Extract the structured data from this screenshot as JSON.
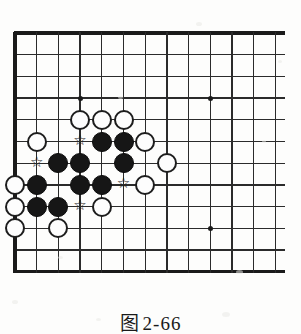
{
  "figure": {
    "caption_label": "图",
    "caption_number": "2-66",
    "caption_full": "图 2-66"
  },
  "board": {
    "type": "go-board-corner",
    "description": "Go board upper-left corner diagram",
    "visible_columns": 13,
    "visible_rows": 12,
    "grid_spacing_px": 21.7,
    "origin_x_px": 15,
    "origin_y_px": 33,
    "edges": [
      "left",
      "top",
      "bottom"
    ],
    "line_color": "#2b2b2b",
    "edge_color": "#1a1a1a",
    "background_color": "#fdfdfc",
    "hoshi_points": [
      {
        "col": 3,
        "row": 3
      },
      {
        "col": 9,
        "row": 3
      },
      {
        "col": 9,
        "row": 9
      }
    ],
    "stone_diameter_px": 20,
    "black_color": "#161616",
    "white_color": "#fdfdfd",
    "black_stones": [
      {
        "col": 4,
        "row": 5
      },
      {
        "col": 5,
        "row": 5
      },
      {
        "col": 2,
        "row": 6
      },
      {
        "col": 3,
        "row": 6
      },
      {
        "col": 5,
        "row": 6
      },
      {
        "col": 1,
        "row": 7
      },
      {
        "col": 3,
        "row": 7
      },
      {
        "col": 4,
        "row": 7
      },
      {
        "col": 1,
        "row": 8
      },
      {
        "col": 2,
        "row": 8
      }
    ],
    "white_stones": [
      {
        "col": 3,
        "row": 4
      },
      {
        "col": 4,
        "row": 4
      },
      {
        "col": 5,
        "row": 4
      },
      {
        "col": 1,
        "row": 5
      },
      {
        "col": 6,
        "row": 5
      },
      {
        "col": 7,
        "row": 6
      },
      {
        "col": 0,
        "row": 7
      },
      {
        "col": 6,
        "row": 7
      },
      {
        "col": 0,
        "row": 8
      },
      {
        "col": 4,
        "row": 8
      },
      {
        "col": 0,
        "row": 9
      },
      {
        "col": 2,
        "row": 9
      }
    ],
    "star_markers": [
      {
        "col": 3,
        "row": 5,
        "symbol": "☆"
      },
      {
        "col": 1,
        "row": 6,
        "symbol": "☆"
      },
      {
        "col": 5,
        "row": 7,
        "symbol": "☆"
      },
      {
        "col": 3,
        "row": 8,
        "symbol": "☆"
      }
    ],
    "star_marker_on_stone": [
      {
        "col": 1,
        "row": 6,
        "note": "marker drawn over intersection left of black group"
      }
    ],
    "marker_symbol": "☆",
    "marker_color": "#1b1b1b"
  }
}
